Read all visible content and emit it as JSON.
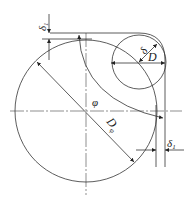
{
  "diagram": {
    "type": "geometric engineering drawing",
    "labels": {
      "delta_top": "δ",
      "delta_top_sub": "1",
      "delta_small": "δ",
      "D_small": "D",
      "phi": "φ",
      "D_main": "D",
      "D_main_sub": "φ",
      "delta_right": "δ",
      "delta_right_sub": "1"
    },
    "colors": {
      "stroke": "#333333",
      "background": "#ffffff"
    }
  }
}
